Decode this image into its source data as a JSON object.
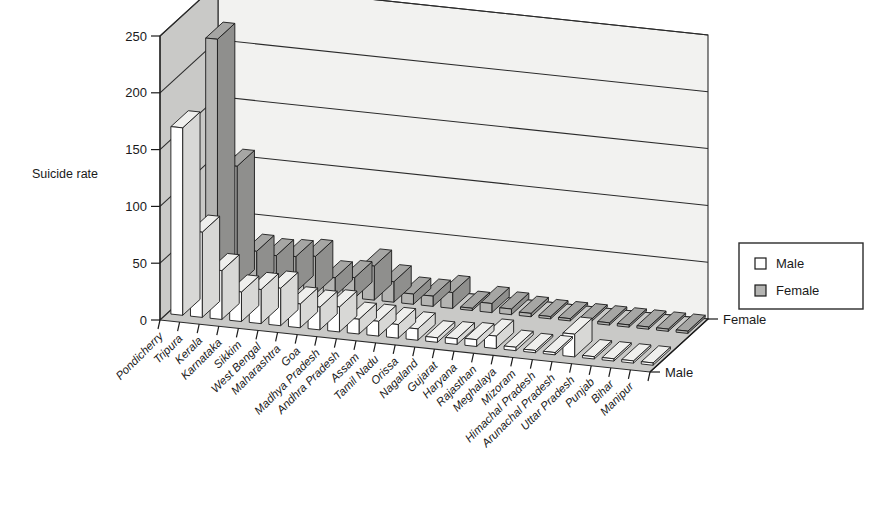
{
  "chart_data": {
    "type": "bar",
    "title": "",
    "subtitle": "",
    "xlabel": "",
    "ylabel": "Suicide rate",
    "ylim": [
      0,
      250
    ],
    "yticks": [
      0,
      50,
      100,
      150,
      200,
      250
    ],
    "grid": true,
    "projection": "3d",
    "legend_position": "right",
    "depth_axis_labels": [
      "Female",
      "Male"
    ],
    "categories": [
      "Pondicherry",
      "Tripura",
      "Kerala",
      "Karnataka",
      "Sikkim",
      "West Bengal",
      "Maharashtra",
      "Goa",
      "Madhya Pradesh",
      "Andhra Pradesh",
      "Assam",
      "Tamil Nadu",
      "Orissa",
      "Nagaland",
      "Gujarat",
      "Haryana",
      "Rajasthan",
      "Meghalaya",
      "Mizoram",
      "Himachal Pradesh",
      "Arunachal Pradesh",
      "Uttar Pradesh",
      "Punjab",
      "Bihar",
      "Manipur"
    ],
    "series": [
      {
        "name": "Male",
        "values": [
          165,
          75,
          43,
          26,
          30,
          33,
          21,
          20,
          22,
          13,
          13,
          12,
          10,
          4,
          5,
          6,
          11,
          3,
          2,
          2,
          20,
          2,
          2,
          2,
          2
        ]
      },
      {
        "name": "Female",
        "values": [
          215,
          105,
          32,
          30,
          31,
          33,
          16,
          18,
          30,
          18,
          9,
          9,
          14,
          2,
          8,
          5,
          3,
          2,
          2,
          2,
          2,
          2,
          2,
          2,
          2
        ]
      }
    ]
  },
  "legend": {
    "items": [
      {
        "label": "Male",
        "color": "#ffffff"
      },
      {
        "label": "Female",
        "color": "#b4b4b2"
      }
    ]
  },
  "axes": {
    "y_label": "Suicide rate",
    "y_tick_labels": [
      "250",
      "200",
      "150",
      "100",
      "50",
      "0"
    ],
    "depth_back_label": "Female",
    "depth_front_label": "Male"
  }
}
